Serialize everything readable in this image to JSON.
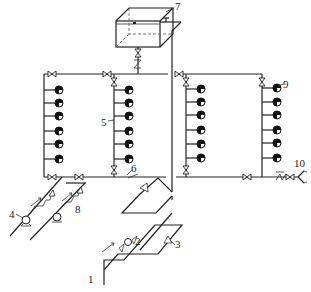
{
  "diagram": {
    "type": "fire-sprinkler water supply system schematic (axonometric)",
    "labels": {
      "l1": "1",
      "l2": "2",
      "l3": "3",
      "l4": "4",
      "l5": "5",
      "l6": "6",
      "l7": "7",
      "l8": "8",
      "l9": "9",
      "l10": "10"
    },
    "components": [
      {
        "id": "1",
        "name": "inlet pipe"
      },
      {
        "id": "2",
        "name": "water meter / pump unit on inlet"
      },
      {
        "id": "3",
        "name": "check valve"
      },
      {
        "id": "4",
        "name": "fire pump"
      },
      {
        "id": "5",
        "name": "riser pipe"
      },
      {
        "id": "6",
        "name": "horizontal ring main"
      },
      {
        "id": "7",
        "name": "roof water tank"
      },
      {
        "id": "8",
        "name": "check valve on pump discharge"
      },
      {
        "id": "9",
        "name": "sprinkler / fire hydrant outlet"
      },
      {
        "id": "10",
        "name": "pump adapter (siamese connection)"
      }
    ],
    "risers": [
      {
        "name": "riser-a",
        "outlets": 6
      },
      {
        "name": "riser-b",
        "outlets": 6
      },
      {
        "name": "riser-c",
        "outlets": 6
      },
      {
        "name": "riser-d",
        "outlets": 6
      }
    ]
  }
}
